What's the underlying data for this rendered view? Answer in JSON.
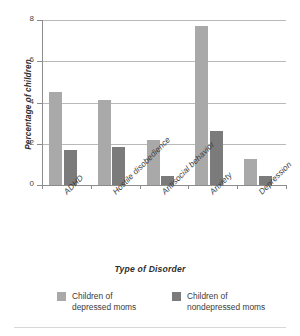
{
  "chart_data": {
    "type": "bar",
    "title": "",
    "xlabel": "Type of Disorder",
    "ylabel": "Percentage of children",
    "categories": [
      "ADHD",
      "Hostile disobedience",
      "Antisocial behavior",
      "Anxiety",
      "Depression"
    ],
    "series": [
      {
        "name": "Children of depressed moms",
        "color": "#a9a9a9",
        "values": [
          4.5,
          4.1,
          2.2,
          7.7,
          1.25
        ]
      },
      {
        "name": "Children of nondepressed moms",
        "color": "#7b7b7b",
        "values": [
          1.7,
          1.85,
          0.45,
          2.6,
          0.45
        ]
      }
    ],
    "ylim": [
      0,
      8
    ],
    "yticks": [
      0,
      2,
      4,
      6,
      8
    ],
    "ytick_labels": [
      "0",
      "2",
      "4",
      "6",
      "8"
    ],
    "grid": "horizontal",
    "legend_position": "bottom"
  },
  "axes": {
    "y_title": "Percentage of children",
    "x_title": "Type of Disorder"
  },
  "legend": {
    "items": [
      {
        "label_line1": "Children of",
        "label_line2": "depressed moms",
        "color": "#a9a9a9"
      },
      {
        "label_line1": "Children of",
        "label_line2": "nondepressed moms",
        "color": "#7b7b7b"
      }
    ]
  }
}
